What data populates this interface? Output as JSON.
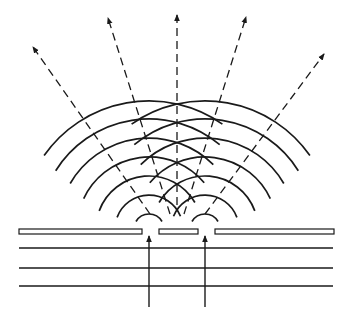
{
  "diagram": {
    "type": "double-slit-interference",
    "colors": {
      "ink": "#1a1a1a",
      "background": "#ffffff"
    },
    "barrier": {
      "y_top": 229,
      "y_bottom": 234,
      "plates": [
        {
          "x1": 19,
          "x2": 142
        },
        {
          "x1": 159,
          "x2": 198
        },
        {
          "x1": 215,
          "x2": 334
        }
      ]
    },
    "slits": [
      {
        "x": 149
      },
      {
        "x": 205
      }
    ],
    "incident_wavefronts": [
      {
        "y": 248
      },
      {
        "y": 268
      },
      {
        "y": 286
      }
    ],
    "incident_wavefront_x": [
      19,
      333
    ],
    "incident_rays": [
      {
        "x": 149,
        "y_start": 307,
        "y_end": 236
      },
      {
        "x": 205,
        "y_start": 307,
        "y_end": 236
      }
    ],
    "wave_arcs": {
      "source_y": 229,
      "radii": [
        15,
        33,
        51,
        70,
        89,
        108,
        127,
        135
      ],
      "left_source_arcs": [
        {
          "r": 15,
          "a0": 150,
          "a1": 30
        },
        {
          "r": 34,
          "a0": 160,
          "a1": 22
        },
        {
          "r": 53,
          "a0": 160,
          "a1": 30
        },
        {
          "r": 72,
          "a0": 155,
          "a1": 40
        },
        {
          "r": 91,
          "a0": 150,
          "a1": 45
        },
        {
          "r": 110,
          "a0": 148,
          "a1": 50
        },
        {
          "r": 128,
          "a0": 145,
          "a1": 55
        }
      ],
      "right_source_arcs": [
        {
          "r": 15,
          "a0": 150,
          "a1": 30
        },
        {
          "r": 34,
          "a0": 158,
          "a1": 20
        },
        {
          "r": 53,
          "a0": 150,
          "a1": 20
        },
        {
          "r": 72,
          "a0": 140,
          "a1": 25
        },
        {
          "r": 91,
          "a0": 135,
          "a1": 30
        },
        {
          "r": 110,
          "a0": 130,
          "a1": 32
        },
        {
          "r": 128,
          "a0": 125,
          "a1": 35
        }
      ]
    },
    "rays": [
      {
        "name": "ray-far-left",
        "x1": 150,
        "y1": 214,
        "x2": 33,
        "y2": 47
      },
      {
        "name": "ray-left",
        "x1": 170,
        "y1": 214,
        "x2": 108,
        "y2": 18
      },
      {
        "name": "ray-center",
        "x1": 177,
        "y1": 205,
        "x2": 177,
        "y2": 15
      },
      {
        "name": "ray-right",
        "x1": 184,
        "y1": 214,
        "x2": 246,
        "y2": 17
      },
      {
        "name": "ray-far-right",
        "x1": 205,
        "y1": 214,
        "x2": 324,
        "y2": 54
      }
    ]
  }
}
